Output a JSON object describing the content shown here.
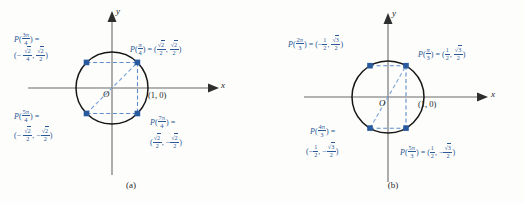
{
  "figure": {
    "colors": {
      "label_blue": "#2b5896",
      "point_blue": "#2a5a9e",
      "axis_black": "#4a4a4a",
      "circle_black": "#1a1a1a",
      "dashed_blue": "#5c8ccb"
    }
  },
  "panels": [
    {
      "caption": "(a)",
      "axis": {
        "x_label": "x",
        "y_label": "y",
        "origin_label": "O"
      },
      "unit_point_label": "(1, 0)",
      "denominator": "4",
      "radical_value": "2",
      "points": [
        {
          "name": "pi-over-4",
          "angle_label_fn": "P",
          "angle_num": "π",
          "angle_den": "4",
          "equals": "=",
          "coord_x": "√2/2",
          "coord_y": "√2/2",
          "x_sign": "",
          "y_sign": "",
          "angle_deg": 45
        },
        {
          "name": "three-pi-over-4",
          "angle_label_fn": "P",
          "angle_num": "3π",
          "angle_den": "4",
          "equals": "=",
          "coord_x": "√2/2",
          "coord_y": "√2/2",
          "x_sign": "−",
          "y_sign": "",
          "angle_deg": 135
        },
        {
          "name": "five-pi-over-4",
          "angle_label_fn": "P",
          "angle_num": "5π",
          "angle_den": "4",
          "equals": "=",
          "coord_x": "√2/2",
          "coord_y": "√2/2",
          "x_sign": "−",
          "y_sign": "−",
          "angle_deg": 225
        },
        {
          "name": "seven-pi-over-4",
          "angle_label_fn": "P",
          "angle_num": "7π",
          "angle_den": "4",
          "equals": "=",
          "coord_x": "√2/2",
          "coord_y": "√2/2",
          "x_sign": "",
          "y_sign": "−",
          "angle_deg": 315
        }
      ]
    },
    {
      "caption": "(b)",
      "axis": {
        "x_label": "x",
        "y_label": "y",
        "origin_label": "O"
      },
      "unit_point_label": "(1, 0)",
      "denominator": "3",
      "radical_value": "3",
      "points": [
        {
          "name": "pi-over-3",
          "angle_label_fn": "P",
          "angle_num": "π",
          "angle_den": "3",
          "equals": "=",
          "coord_x": "1/2",
          "coord_y": "√3/2",
          "x_sign": "",
          "y_sign": "",
          "angle_deg": 60
        },
        {
          "name": "two-pi-over-3",
          "angle_label_fn": "P",
          "angle_num": "2π",
          "angle_den": "3",
          "equals": "=",
          "coord_x": "1/2",
          "coord_y": "√3/2",
          "x_sign": "−",
          "y_sign": "",
          "angle_deg": 120
        },
        {
          "name": "four-pi-over-3",
          "angle_label_fn": "P",
          "angle_num": "4π",
          "angle_den": "3",
          "equals": "=",
          "coord_x": "1/2",
          "coord_y": "√3/2",
          "x_sign": "−",
          "y_sign": "−",
          "angle_deg": 240
        },
        {
          "name": "five-pi-over-3",
          "angle_label_fn": "P",
          "angle_num": "5π",
          "angle_den": "3",
          "equals": "=",
          "coord_x": "1/2",
          "coord_y": "√3/2",
          "x_sign": "",
          "y_sign": "−",
          "angle_deg": 300
        }
      ]
    }
  ],
  "text": {
    "minus": "−",
    "lparen": "(",
    "rparen": ")",
    "comma": ",",
    "equals": "=",
    "pi": "π",
    "P": "P",
    "two": "2",
    "three": "3",
    "four": "4",
    "five": "5",
    "seven": "7",
    "one": "1",
    "caption_a": "(a)",
    "caption_b": "(b)",
    "x_axis": "x",
    "y_axis": "y",
    "origin": "O",
    "unit_point": "(1, 0)",
    "sqrt2_over_2": "√2/2",
    "sqrt3_over_2": "√3/2",
    "half": "1/2"
  }
}
